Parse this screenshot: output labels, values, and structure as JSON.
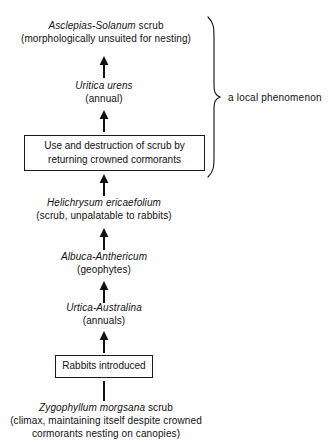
{
  "diagram": {
    "ink_color": "#111111",
    "background": "#ffffff",
    "nodes": [
      {
        "id": "asclepias-solanum",
        "kind": "text",
        "lines": [
          {
            "sci": "Asclepias-Solanum",
            "roman": " scrub"
          },
          {
            "sci": "",
            "roman": "(morphologically unsuited for nesting)"
          }
        ]
      },
      {
        "id": "uritica-urens",
        "kind": "text",
        "lines": [
          {
            "sci": "Uritica urens",
            "roman": ""
          },
          {
            "sci": "",
            "roman": "(annual)"
          }
        ]
      },
      {
        "id": "use-destruction-scrub",
        "kind": "box",
        "lines": [
          {
            "sci": "",
            "roman": "Use and destruction of scrub by"
          },
          {
            "sci": "",
            "roman": "returning crowned cormorants"
          }
        ]
      },
      {
        "id": "helichrysum-ericaefolium",
        "kind": "text",
        "lines": [
          {
            "sci": "Helichrysum ericaefolium",
            "roman": ""
          },
          {
            "sci": "",
            "roman": "(scrub, unpalatable to rabbits)"
          }
        ]
      },
      {
        "id": "albuca-anthericum",
        "kind": "text",
        "lines": [
          {
            "sci": "Albuca-Anthericum",
            "roman": ""
          },
          {
            "sci": "",
            "roman": "(geophytes)"
          }
        ]
      },
      {
        "id": "urtica-australina",
        "kind": "text",
        "lines": [
          {
            "sci": "Urtica-Australina",
            "roman": ""
          },
          {
            "sci": "",
            "roman": "(annuals)"
          }
        ]
      },
      {
        "id": "rabbits-introduced",
        "kind": "box",
        "lines": [
          {
            "sci": "",
            "roman": "Rabbits introduced"
          }
        ]
      },
      {
        "id": "zygophyllum-morgsana",
        "kind": "text",
        "lines": [
          {
            "sci": "Zygophyllum morgsana",
            "roman": " scrub"
          },
          {
            "sci": "",
            "roman": "(climax, maintaining itself despite crowned"
          },
          {
            "sci": "",
            "roman": "cormorants nesting on canopies)"
          }
        ]
      }
    ],
    "connectors": [
      {
        "id": "arrow-to-asclepias",
        "type": "arrow-up"
      },
      {
        "id": "arrow-to-uritica",
        "type": "arrow-up"
      },
      {
        "id": "arrow-to-use-destruction",
        "type": "arrow-up"
      },
      {
        "id": "arrow-to-helichrysum",
        "type": "arrow-up"
      },
      {
        "id": "arrow-to-albuca",
        "type": "arrow-up"
      },
      {
        "id": "arrow-to-urtica-australina",
        "type": "arrow-up"
      },
      {
        "id": "line-rabbits-to-zygophyllum",
        "type": "plain-line"
      }
    ],
    "annotation": {
      "id": "local-phenomenon-brace",
      "label": "a local phenomenon"
    }
  }
}
